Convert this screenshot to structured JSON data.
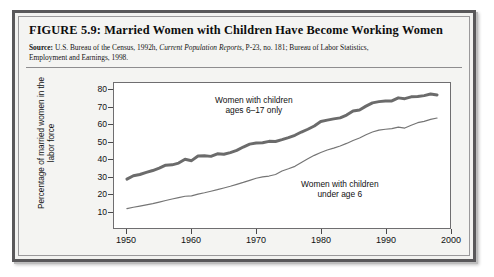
{
  "figure": {
    "title": "FIGURE 5.9:  Married Women with Children Have Become Working Women",
    "source_label": "Source:",
    "source_text_1": " U.S. Bureau of the Census, 1992h, ",
    "source_italic": "Current Population Reports,",
    "source_text_2": " P-23, no. 181; Bureau of Labor Statistics,",
    "source_text_3": "Employment and Earnings, 1998."
  },
  "chart_data": {
    "type": "line",
    "title": "Married Women with Children Have Become Working Women",
    "xlabel": "",
    "ylabel": "Percentage of married women in the labor force",
    "xlim": [
      1948,
      2000
    ],
    "ylim": [
      0,
      84
    ],
    "grid": false,
    "legend_position": "inline-annotations",
    "xticks": [
      1950,
      1960,
      1970,
      1980,
      1990,
      2000
    ],
    "yticks": [
      10,
      20,
      30,
      40,
      50,
      60,
      70,
      80
    ],
    "annotations": [
      {
        "name": "upper-series-label",
        "line1": "Women with children",
        "line2": "ages 6–17 only"
      },
      {
        "name": "lower-series-label",
        "line1": "Women with children",
        "line2": "under age 6"
      }
    ],
    "series": [
      {
        "name": "Women with children ages 6–17 only",
        "color": "#6b6b6b",
        "width": 3.0,
        "x": [
          1950,
          1951,
          1952,
          1953,
          1954,
          1955,
          1956,
          1957,
          1958,
          1959,
          1960,
          1961,
          1962,
          1963,
          1964,
          1965,
          1966,
          1967,
          1968,
          1969,
          1970,
          1971,
          1972,
          1973,
          1974,
          1975,
          1976,
          1977,
          1978,
          1979,
          1980,
          1981,
          1982,
          1983,
          1984,
          1985,
          1986,
          1987,
          1988,
          1989,
          1990,
          1991,
          1992,
          1993,
          1994,
          1995,
          1996,
          1997,
          1998
        ],
        "values": [
          28.3,
          30.3,
          31.0,
          32.2,
          33.3,
          34.7,
          36.4,
          36.6,
          37.6,
          39.8,
          39.0,
          41.7,
          41.8,
          41.5,
          43.0,
          42.7,
          43.7,
          45.0,
          46.9,
          48.6,
          49.2,
          49.4,
          50.2,
          50.1,
          51.2,
          52.4,
          53.7,
          55.6,
          57.2,
          59.1,
          61.7,
          62.5,
          63.2,
          63.8,
          65.4,
          67.8,
          68.4,
          70.6,
          72.5,
          73.2,
          73.6,
          73.6,
          75.4,
          74.9,
          76.0,
          76.2,
          76.7,
          77.6,
          77.1
        ]
      },
      {
        "name": "Women with children under age 6",
        "color": "#757575",
        "width": 1.2,
        "x": [
          1950,
          1951,
          1952,
          1953,
          1954,
          1955,
          1956,
          1957,
          1958,
          1959,
          1960,
          1961,
          1962,
          1963,
          1964,
          1965,
          1966,
          1967,
          1968,
          1969,
          1970,
          1971,
          1972,
          1973,
          1974,
          1975,
          1976,
          1977,
          1978,
          1979,
          1980,
          1981,
          1982,
          1983,
          1984,
          1985,
          1986,
          1987,
          1988,
          1989,
          1990,
          1991,
          1992,
          1993,
          1994,
          1995,
          1996,
          1997,
          1998
        ],
        "values": [
          11.2,
          12.0,
          12.7,
          13.4,
          14.1,
          15.0,
          15.9,
          16.8,
          17.6,
          18.4,
          18.6,
          19.6,
          20.4,
          21.3,
          22.2,
          23.2,
          24.2,
          25.3,
          26.4,
          27.6,
          28.8,
          29.6,
          30.1,
          31.0,
          33.0,
          34.3,
          35.7,
          38.0,
          40.1,
          42.1,
          43.7,
          45.2,
          46.3,
          47.5,
          49.0,
          50.7,
          52.1,
          54.0,
          55.6,
          56.7,
          57.2,
          57.6,
          58.4,
          57.9,
          59.5,
          61.0,
          61.8,
          62.9,
          63.7
        ]
      }
    ]
  }
}
